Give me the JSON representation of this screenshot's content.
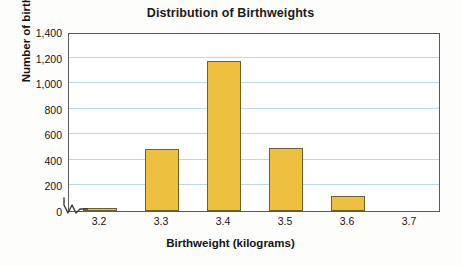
{
  "chart_data": {
    "type": "bar",
    "title": "Distribution of Birthweights",
    "xlabel": "Birthweight (kilograms)",
    "ylabel": "Number of births",
    "categories": [
      "3.2",
      "3.3",
      "3.4",
      "3.5",
      "3.6",
      "3.7"
    ],
    "values": [
      12,
      485,
      1175,
      495,
      120,
      0
    ],
    "ylim": [
      0,
      1400
    ],
    "ytick_values": [
      0,
      200,
      400,
      600,
      800,
      1000,
      1200,
      1400
    ],
    "ytick_labels": [
      "0",
      "200",
      "400",
      "600",
      "800",
      "1,000",
      "1,200",
      "1,400"
    ],
    "grid": true,
    "legend": null,
    "axis_break": true,
    "colors": {
      "bar_fill": "#edc040",
      "bar_border": "#6f6129",
      "gridline": "#bcd9ec",
      "plot_border": "#5a5a5a",
      "text": "#141414",
      "background": "#fdfdfb"
    }
  }
}
